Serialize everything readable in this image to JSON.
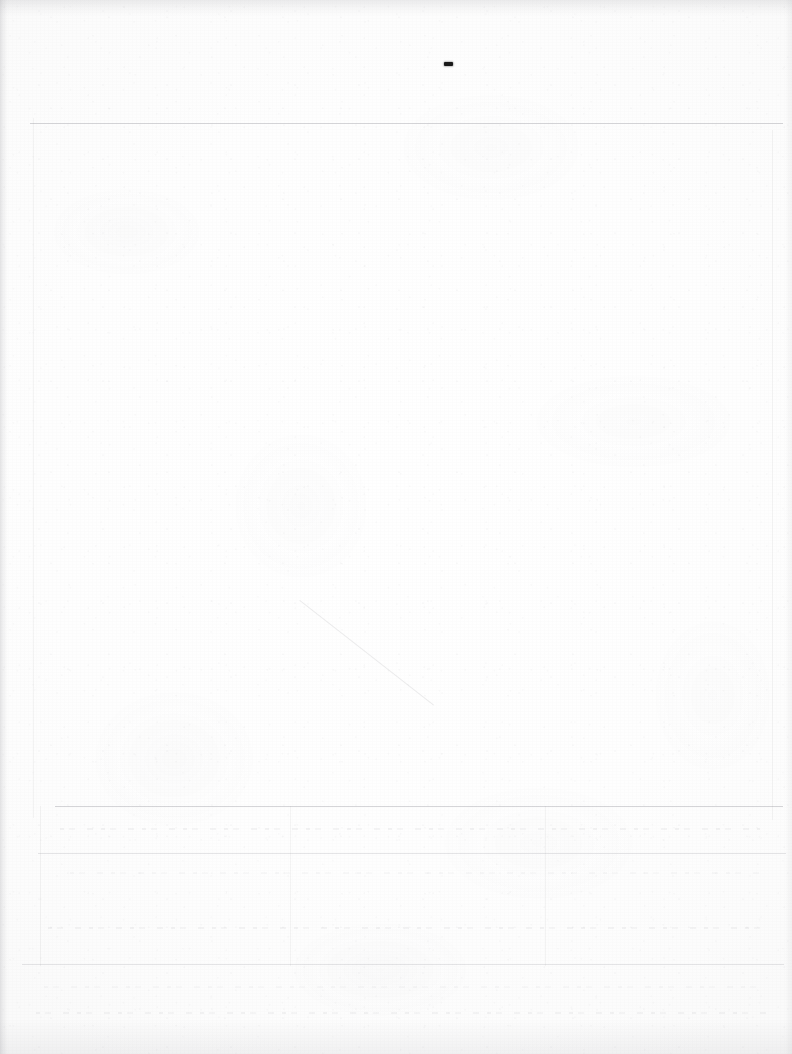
{
  "document": {
    "kind": "scanned-page",
    "title": "Blank scanned document page",
    "page_width": 792,
    "page_height": 1054,
    "background_color": "#fefefe",
    "visible_text": "",
    "notes": "Near-blank scanned sheet: paper grain, faint ruled lines, a single small dark dash mark near the top center."
  },
  "marks": {
    "ink_dash": {
      "label": "-",
      "x": 444,
      "y": 62,
      "width": 9,
      "height": 4,
      "color": "#191919"
    }
  },
  "rules": {
    "horizontal": [
      {
        "name": "top-rule",
        "x": 30,
        "y": 123,
        "width": 753,
        "weight": "normal"
      },
      {
        "name": "bottom-block-rule-1",
        "x": 55,
        "y": 806,
        "width": 728,
        "weight": "normal"
      },
      {
        "name": "bottom-block-rule-2",
        "x": 38,
        "y": 853,
        "width": 748,
        "weight": "faint"
      },
      {
        "name": "bottom-block-rule-3",
        "x": 22,
        "y": 964,
        "width": 762,
        "weight": "faint"
      }
    ],
    "vertical": [
      {
        "name": "left-margin-rule",
        "x": 33,
        "y": 118,
        "height": 700,
        "weight": "fainter"
      },
      {
        "name": "right-margin-rule",
        "x": 772,
        "y": 130,
        "height": 690,
        "weight": "fainter"
      },
      {
        "name": "bottom-column-rule-left",
        "x": 40,
        "y": 806,
        "height": 160,
        "weight": "fainter"
      },
      {
        "name": "bottom-column-rule-mid",
        "x": 290,
        "y": 806,
        "height": 160,
        "weight": "fainter"
      },
      {
        "name": "bottom-column-rule-right",
        "x": 545,
        "y": 806,
        "height": 160,
        "weight": "fainter"
      }
    ]
  },
  "ghost_rows": [
    {
      "name": "ghost-row-1",
      "x": 60,
      "y": 828,
      "width": 700
    },
    {
      "name": "ghost-row-2",
      "x": 70,
      "y": 872,
      "width": 690
    },
    {
      "name": "ghost-row-3",
      "x": 48,
      "y": 927,
      "width": 712
    },
    {
      "name": "ghost-row-4",
      "x": 44,
      "y": 986,
      "width": 720
    },
    {
      "name": "ghost-row-5",
      "x": 36,
      "y": 1012,
      "width": 736
    }
  ],
  "artifacts": {
    "diagonal_streak": {
      "name": "diagonal-streak",
      "x": 300,
      "y": 600,
      "length": 170,
      "angle_deg": 38
    },
    "edges": [
      "left",
      "right",
      "top",
      "bottom"
    ]
  }
}
